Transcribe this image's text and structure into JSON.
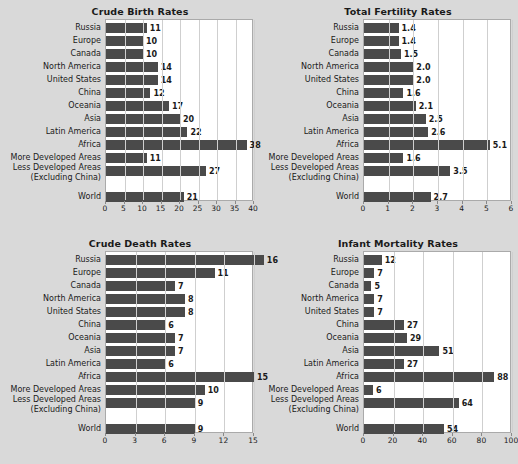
{
  "figure": {
    "background_color": "#d9d9d9",
    "bar_color": "#4a4a4a",
    "plot_background": "#ffffff",
    "gridline_color": "#cfcfcf"
  },
  "categories": [
    "Russia",
    "Europe",
    "Canada",
    "North America",
    "United States",
    "China",
    "Oceania",
    "Asia",
    "Latin America",
    "Africa",
    "More Developed Areas",
    "Less Developed Areas",
    "World"
  ],
  "category_sublabels": {
    "Less Developed Areas": "(Excluding China)"
  },
  "chart_data": [
    {
      "type": "bar",
      "orientation": "horizontal",
      "title": "Crude Birth Rates",
      "xlabel": "",
      "ylabel": "",
      "categories": [
        "Russia",
        "Europe",
        "Canada",
        "North America",
        "United States",
        "China",
        "Oceania",
        "Asia",
        "Latin America",
        "Africa",
        "More Developed Areas",
        "Less Developed Areas (Excluding China)",
        "World"
      ],
      "values": [
        11,
        10,
        10,
        14,
        14,
        12,
        17,
        20,
        22,
        38,
        11,
        27,
        21
      ],
      "value_labels": [
        "11",
        "10",
        "10",
        "14",
        "14",
        "12",
        "17",
        "20",
        "22",
        "38",
        "11",
        "27",
        "21"
      ],
      "xlim": [
        0,
        40
      ],
      "xticks": [
        0,
        5,
        10,
        15,
        20,
        25,
        30,
        35,
        40
      ],
      "xtick_labels": [
        "0",
        "5",
        "10",
        "15",
        "20",
        "25",
        "30",
        "35",
        "40"
      ],
      "grid": true,
      "legend": "none"
    },
    {
      "type": "bar",
      "orientation": "horizontal",
      "title": "Total Fertility Rates",
      "xlabel": "",
      "ylabel": "",
      "categories": [
        "Russia",
        "Europe",
        "Canada",
        "North America",
        "United States",
        "China",
        "Oceania",
        "Asia",
        "Latin America",
        "Africa",
        "More Developed Areas",
        "Less Developed Areas (Excluding China)",
        "World"
      ],
      "values": [
        1.4,
        1.4,
        1.5,
        2.0,
        2.0,
        1.6,
        2.1,
        2.5,
        2.6,
        5.1,
        1.6,
        3.5,
        2.7
      ],
      "value_labels": [
        "1.4",
        "1.4",
        "1.5",
        "2.0",
        "2.0",
        "1.6",
        "2.1",
        "2.5",
        "2.6",
        "5.1",
        "1.6",
        "3.5",
        "2.7"
      ],
      "xlim": [
        0,
        6
      ],
      "xticks": [
        0,
        1,
        2,
        3,
        4,
        5,
        6
      ],
      "xtick_labels": [
        "0",
        "1",
        "2",
        "3",
        "4",
        "5",
        "6"
      ],
      "grid": true,
      "legend": "none"
    },
    {
      "type": "bar",
      "orientation": "horizontal",
      "title": "Crude Death Rates",
      "xlabel": "",
      "ylabel": "",
      "categories": [
        "Russia",
        "Europe",
        "Canada",
        "North America",
        "United States",
        "China",
        "Oceania",
        "Asia",
        "Latin America",
        "Africa",
        "More Developed Areas",
        "Less Developed Areas (Excluding China)",
        "World"
      ],
      "values": [
        16,
        11,
        7,
        8,
        8,
        6,
        7,
        7,
        6,
        15,
        10,
        9,
        9
      ],
      "value_labels": [
        "16",
        "11",
        "7",
        "8",
        "8",
        "6",
        "7",
        "7",
        "6",
        "15",
        "10",
        "9",
        "9"
      ],
      "xlim": [
        0,
        15
      ],
      "xticks": [
        0,
        3,
        6,
        9,
        12,
        15
      ],
      "xtick_labels": [
        "0",
        "3",
        "6",
        "9",
        "12",
        "15"
      ],
      "grid": true,
      "legend": "none"
    },
    {
      "type": "bar",
      "orientation": "horizontal",
      "title": "Infant Mortality Rates",
      "xlabel": "",
      "ylabel": "",
      "categories": [
        "Russia",
        "Europe",
        "Canada",
        "North America",
        "United States",
        "China",
        "Oceania",
        "Asia",
        "Latin America",
        "Africa",
        "More Developed Areas",
        "Less Developed Areas (Excluding China)",
        "World"
      ],
      "values": [
        12,
        7,
        5,
        7,
        7,
        27,
        29,
        51,
        27,
        88,
        6,
        64,
        54
      ],
      "value_labels": [
        "12",
        "7",
        "5",
        "7",
        "7",
        "27",
        "29",
        "51",
        "27",
        "88",
        "6",
        "64",
        "54"
      ],
      "xlim": [
        0,
        100
      ],
      "xticks": [
        0,
        20,
        40,
        60,
        80,
        100
      ],
      "xtick_labels": [
        "0",
        "20",
        "40",
        "60",
        "80",
        "100"
      ],
      "grid": true,
      "legend": "none"
    }
  ]
}
